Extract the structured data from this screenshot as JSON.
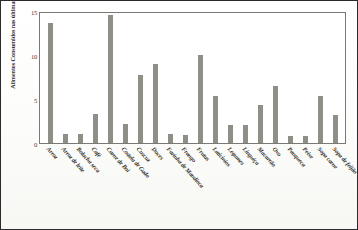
{
  "chart_data": {
    "type": "bar",
    "title": "",
    "xlabel": "",
    "ylabel": "Alimentos Consumidos nas últimas 24h (%)",
    "ylim": [
      0,
      15
    ],
    "yticks": [
      "0",
      "5",
      "10",
      "15"
    ],
    "grid": false,
    "legend": "none",
    "bar_color": "#8f8f87",
    "categories": [
      "Arroz",
      "Arroz de leite",
      "Bolacha seca",
      "Café",
      "Carne de Boi",
      "Costela de Gado",
      "Cuscuz",
      "Doces",
      "Farinha de Mandioca",
      "Frango",
      "Frutas",
      "Laticínios",
      "Legumes",
      "Linguiça",
      "Macarrão",
      "Ovo",
      "Panqueca",
      "Peixe",
      "Sopa carne",
      "Sopa de feijão"
    ],
    "values": [
      13.8,
      1.0,
      1.0,
      3.4,
      14.8,
      2.2,
      7.9,
      9.1,
      1.0,
      0.9,
      10.2,
      5.4,
      2.1,
      2.1,
      4.4,
      6.6,
      0.8,
      0.8,
      5.4,
      3.2
    ]
  }
}
